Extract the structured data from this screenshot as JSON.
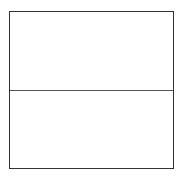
{
  "figure": {
    "shape": "rectangle-split-horizontally",
    "border_color": "#333333",
    "divider_color": "#555555",
    "background": "#ffffff",
    "sections": [
      {
        "position": "top",
        "label": ""
      },
      {
        "position": "bottom",
        "label": ""
      }
    ]
  }
}
